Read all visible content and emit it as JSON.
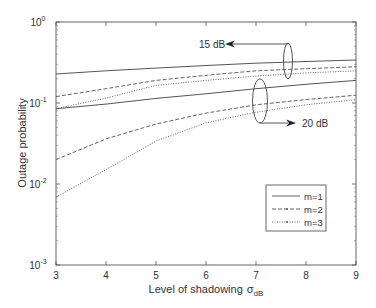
{
  "chart_data": {
    "type": "line",
    "title": "",
    "xlabel": "Level of shadowing",
    "xlabel_symbol": "σ",
    "xlabel_subscript": "dB",
    "ylabel": "Outage probability",
    "xlim": [
      3,
      9
    ],
    "ylim": [
      0.001,
      1
    ],
    "yscale": "log",
    "grid": false,
    "x_ticks": [
      3,
      4,
      5,
      6,
      7,
      8,
      9
    ],
    "y_ticks": [
      {
        "value": 1,
        "base": "10",
        "exp": "0"
      },
      {
        "value": 0.1,
        "base": "10",
        "exp": "-1"
      },
      {
        "value": 0.01,
        "base": "10",
        "exp": "-2"
      },
      {
        "value": 0.001,
        "base": "10",
        "exp": "-3"
      }
    ],
    "x": [
      3,
      4,
      5,
      6,
      7,
      8,
      9
    ],
    "series": [
      {
        "name": "m=1",
        "group": "15 dB",
        "style": "solid",
        "values": [
          0.228,
          0.25,
          0.27,
          0.29,
          0.31,
          0.325,
          0.34
        ]
      },
      {
        "name": "m=2",
        "group": "15 dB",
        "style": "dashed",
        "values": [
          0.12,
          0.15,
          0.19,
          0.22,
          0.25,
          0.265,
          0.28
        ]
      },
      {
        "name": "m=3",
        "group": "15 dB",
        "style": "dotted",
        "values": [
          0.085,
          0.115,
          0.165,
          0.19,
          0.215,
          0.235,
          0.25
        ]
      },
      {
        "name": "m=1",
        "group": "20 dB",
        "style": "solid",
        "values": [
          0.085,
          0.097,
          0.114,
          0.13,
          0.15,
          0.17,
          0.19
        ]
      },
      {
        "name": "m=2",
        "group": "20 dB",
        "style": "dashed",
        "values": [
          0.02,
          0.036,
          0.055,
          0.075,
          0.095,
          0.11,
          0.125
        ]
      },
      {
        "name": "m=3",
        "group": "20 dB",
        "style": "dotted",
        "values": [
          0.0069,
          0.015,
          0.034,
          0.057,
          0.077,
          0.095,
          0.11
        ]
      }
    ],
    "annotations": [
      {
        "text": "15 dB",
        "target": "upper curve group"
      },
      {
        "text": "20 dB",
        "target": "lower curve group"
      }
    ],
    "legend": {
      "position": "lower right",
      "entries": [
        {
          "label": "m=1",
          "style": "solid"
        },
        {
          "label": "m=2",
          "style": "dashed"
        },
        {
          "label": "m=3",
          "style": "dotted"
        }
      ]
    }
  }
}
